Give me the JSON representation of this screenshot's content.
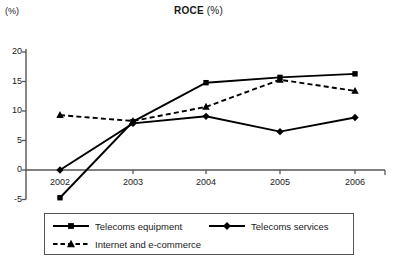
{
  "chart_data": {
    "type": "line",
    "title": "ROCE (%)",
    "title_bold_part": "ROCE",
    "title_normal_part": " (%)",
    "ylabel": "(%)",
    "xlabel": "",
    "categories": [
      "2002",
      "2003",
      "2004",
      "2005",
      "2006"
    ],
    "ylim": [
      -5,
      20
    ],
    "yticks": [
      -5,
      0,
      5,
      10,
      15,
      20
    ],
    "ytick_labels": [
      "-5",
      "0",
      "5",
      "10",
      "15",
      "20"
    ],
    "grid": false,
    "legend_position": "bottom",
    "series": [
      {
        "name": "Telecoms equipment",
        "marker": "square",
        "linestyle": "solid",
        "color": "#000000",
        "values": [
          -4.7,
          8.2,
          14.8,
          15.7,
          16.3
        ]
      },
      {
        "name": "Telecoms services",
        "marker": "diamond",
        "linestyle": "solid",
        "color": "#000000",
        "values": [
          0.0,
          7.9,
          9.1,
          6.5,
          8.9
        ]
      },
      {
        "name": "Internet and e-commerce",
        "marker": "triangle",
        "linestyle": "dashed",
        "color": "#000000",
        "values": [
          9.3,
          8.3,
          10.7,
          15.3,
          13.4
        ]
      }
    ]
  },
  "legend": {
    "items": [
      {
        "label": "Telecoms equipment"
      },
      {
        "label": "Telecoms services"
      },
      {
        "label": "Internet and e-commerce"
      }
    ]
  }
}
